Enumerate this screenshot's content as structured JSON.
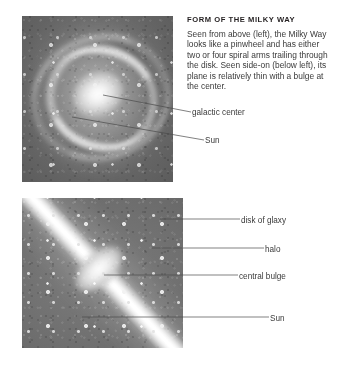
{
  "article": {
    "heading": "FORM OF THE MILKY WAY",
    "body": "Seen from above (left), the Milky Way looks like a pinwheel and has either two or four spiral arms trailing through the disk. Seen side-on (below left), its plane is relatively thin with a bulge at the center."
  },
  "figures": [
    {
      "id": "spiral-galaxy",
      "view": "face-on",
      "caption_alt": "Face-on photograph of a spiral galaxy showing a bright core and pinwheel arms",
      "callouts": [
        {
          "id": "galactic-center",
          "label": "galactic center"
        },
        {
          "id": "sun-top",
          "label": "Sun"
        }
      ]
    },
    {
      "id": "edge-on-galaxy",
      "view": "side-on",
      "caption_alt": "Edge-on photograph of a galaxy showing a thin bright diagonal disk with a central bulge",
      "callouts": [
        {
          "id": "disk-of-galaxy",
          "label": "disk of glaxy"
        },
        {
          "id": "halo",
          "label": "halo"
        },
        {
          "id": "central-bulge",
          "label": "central bulge"
        },
        {
          "id": "sun-bottom",
          "label": "Sun"
        }
      ]
    }
  ],
  "colors": {
    "page_background": "#ffffff",
    "text": "#231f20",
    "body_text": "#3a3a3a",
    "leader_line": "#4a4a4a",
    "plate_base": "#6e6e6e"
  }
}
